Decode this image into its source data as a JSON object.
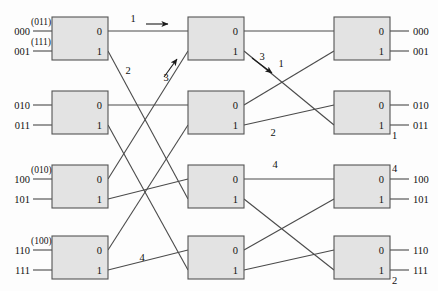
{
  "diagram": {
    "stage_count": 3,
    "rows_per_stage": 4,
    "port_labels": {
      "upper": "0",
      "lower": "1"
    },
    "stages": [
      {
        "index": 1,
        "switches": [
          {
            "id": "s1-1",
            "x": 52,
            "y": 17,
            "w": 56,
            "h": 43,
            "ports": [
              "0",
              "1"
            ]
          },
          {
            "id": "s1-2",
            "x": 52,
            "y": 91,
            "w": 56,
            "h": 43,
            "ports": [
              "0",
              "1"
            ]
          },
          {
            "id": "s1-3",
            "x": 52,
            "y": 165,
            "w": 56,
            "h": 43,
            "ports": [
              "0",
              "1"
            ]
          },
          {
            "id": "s1-4",
            "x": 52,
            "y": 236,
            "w": 56,
            "h": 43,
            "ports": [
              "0",
              "1"
            ]
          }
        ]
      },
      {
        "index": 2,
        "switches": [
          {
            "id": "s2-1",
            "x": 188,
            "y": 17,
            "w": 56,
            "h": 43,
            "ports": [
              "0",
              "1"
            ]
          },
          {
            "id": "s2-2",
            "x": 188,
            "y": 91,
            "w": 56,
            "h": 43,
            "ports": [
              "0",
              "1"
            ]
          },
          {
            "id": "s2-3",
            "x": 188,
            "y": 165,
            "w": 56,
            "h": 43,
            "ports": [
              "0",
              "1"
            ]
          },
          {
            "id": "s2-4",
            "x": 188,
            "y": 236,
            "w": 56,
            "h": 43,
            "ports": [
              "0",
              "1"
            ]
          }
        ]
      },
      {
        "index": 3,
        "switches": [
          {
            "id": "s3-1",
            "x": 334,
            "y": 17,
            "w": 56,
            "h": 43,
            "ports": [
              "0",
              "1"
            ]
          },
          {
            "id": "s3-2",
            "x": 334,
            "y": 91,
            "w": 56,
            "h": 43,
            "ports": [
              "0",
              "1"
            ]
          },
          {
            "id": "s3-3",
            "x": 334,
            "y": 165,
            "w": 56,
            "h": 43,
            "ports": [
              "0",
              "1"
            ]
          },
          {
            "id": "s3-4",
            "x": 334,
            "y": 236,
            "w": 56,
            "h": 43,
            "ports": [
              "0",
              "1"
            ]
          }
        ]
      }
    ],
    "inputs": [
      {
        "address": "000",
        "annotation": "(011)",
        "y": 31
      },
      {
        "address": "001",
        "annotation": "(111)",
        "y": 51
      },
      {
        "address": "010",
        "annotation": "",
        "y": 105
      },
      {
        "address": "011",
        "annotation": "",
        "y": 125
      },
      {
        "address": "100",
        "annotation": "(010)",
        "y": 179
      },
      {
        "address": "101",
        "annotation": "",
        "y": 199
      },
      {
        "address": "110",
        "annotation": "(100)",
        "y": 250
      },
      {
        "address": "111",
        "annotation": "",
        "y": 270
      }
    ],
    "outputs": [
      {
        "address": "000",
        "y": 31,
        "tag": ""
      },
      {
        "address": "001",
        "y": 51,
        "tag": ""
      },
      {
        "address": "010",
        "y": 105,
        "tag": ""
      },
      {
        "address": "011",
        "y": 125,
        "tag": "1"
      },
      {
        "address": "100",
        "y": 179,
        "tag": "4"
      },
      {
        "address": "101",
        "y": 199,
        "tag": ""
      },
      {
        "address": "110",
        "y": 250,
        "tag": ""
      },
      {
        "address": "111",
        "y": 270,
        "tag": "2"
      }
    ],
    "path_tags": [
      {
        "label": "1",
        "x": 133,
        "y": 22,
        "note": "stage1-row1-upper-out"
      },
      {
        "label": "2",
        "x": 128,
        "y": 74,
        "note": "stage1-row1-lower-out"
      },
      {
        "label": "3",
        "x": 166,
        "y": 81,
        "note": "into-stage2-row1-lower-in"
      },
      {
        "label": "3",
        "x": 262,
        "y": 60,
        "note": "stage2-row1-lower-out"
      },
      {
        "label": "1",
        "x": 281,
        "y": 67,
        "note": "stage2-row2-upper-out"
      },
      {
        "label": "2",
        "x": 273,
        "y": 136,
        "note": "stage2-row3-lower-out"
      },
      {
        "label": "4",
        "x": 275,
        "y": 168,
        "note": "stage2-row4-upper-out"
      },
      {
        "label": "4",
        "x": 142,
        "y": 261,
        "note": "stage1-row4-lower-out"
      }
    ],
    "arrows": [
      {
        "name": "arrow-right-top",
        "x1": 146,
        "y1": 24,
        "x2": 168,
        "y2": 24
      },
      {
        "name": "arrow-up-right-stage2",
        "x1": 164,
        "y1": 77,
        "x2": 177,
        "y2": 59
      },
      {
        "name": "arrow-down-right-stage2",
        "x1": 252,
        "y1": 58,
        "x2": 272,
        "y2": 73
      }
    ],
    "links_stage1_to_stage2": [
      {
        "from": "s1-1.0",
        "to": "s2-1.in-top"
      },
      {
        "from": "s1-1.1",
        "to": "s2-3.in-bottom"
      },
      {
        "from": "s1-2.0",
        "to": "s2-2.in-top"
      },
      {
        "from": "s1-2.1",
        "to": "s2-4.in-bottom"
      },
      {
        "from": "s1-3.0",
        "to": "s2-1.in-bottom"
      },
      {
        "from": "s1-3.1",
        "to": "s2-3.in-top"
      },
      {
        "from": "s1-4.0",
        "to": "s2-2.in-bottom"
      },
      {
        "from": "s1-4.1",
        "to": "s2-4.in-top"
      }
    ],
    "links_stage2_to_stage3": [
      {
        "from": "s2-1.0",
        "to": "s3-1.in-top"
      },
      {
        "from": "s2-1.1",
        "to": "s3-2.in-bottom"
      },
      {
        "from": "s2-2.0",
        "to": "s3-1.in-bottom"
      },
      {
        "from": "s2-2.1",
        "to": "s3-2.in-top"
      },
      {
        "from": "s2-3.0",
        "to": "s3-3.in-top"
      },
      {
        "from": "s2-3.1",
        "to": "s3-4.in-bottom"
      },
      {
        "from": "s2-4.0",
        "to": "s3-3.in-bottom"
      },
      {
        "from": "s2-4.1",
        "to": "s3-4.in-top"
      }
    ],
    "colors": {
      "box_fill": "#e3e3e3",
      "box_stroke": "#555555",
      "wire": "#4a4a4a",
      "text": "#111111"
    }
  }
}
